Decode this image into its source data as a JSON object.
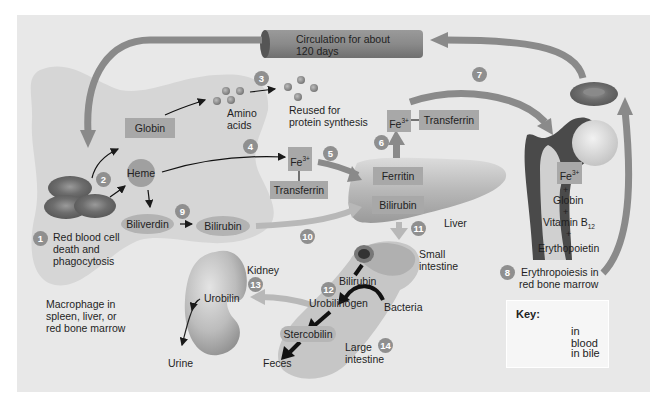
{
  "colors": {
    "background_panel": "#e8e8e8",
    "macrophage": "#d6d6d6",
    "blood_arrow": "#8a8a8a",
    "bile_arrow": "#b8b8b8",
    "box_fill": "#a8a8a8",
    "step_badge": "#8f8f8f",
    "red_cell": "#7a7a7a"
  },
  "circulation": {
    "label_line1": "Circulation for about",
    "label_line2": "120 days"
  },
  "macrophage": {
    "label_line1": "Macrophage in",
    "label_line2": "spleen, liver, or",
    "label_line3": "red bone marrow"
  },
  "steps": [
    {
      "num": "1",
      "text_line1": "Red blood cell",
      "text_line2": "death and",
      "text_line3": "phagocytosis"
    },
    {
      "num": "2"
    },
    {
      "num": "3"
    },
    {
      "num": "4"
    },
    {
      "num": "5"
    },
    {
      "num": "6"
    },
    {
      "num": "7"
    },
    {
      "num": "8",
      "text_line1": "Erythropoiesis in",
      "text_line2": "red bone marrow"
    },
    {
      "num": "9"
    },
    {
      "num": "10"
    },
    {
      "num": "11"
    },
    {
      "num": "12"
    },
    {
      "num": "13"
    },
    {
      "num": "14"
    }
  ],
  "nodes": {
    "globin": "Globin",
    "heme": "Heme",
    "biliverdin": "Biliverdin",
    "bilirubin_macrophage": "Bilirubin",
    "amino_acids_line1": "Amino",
    "amino_acids_line2": "acids",
    "reused_line1": "Reused for",
    "reused_line2": "protein synthesis",
    "fe_4": "Fe",
    "fe_4_sup": "3+",
    "transferrin_4": "Transferrin",
    "fe_6": "Fe",
    "fe_6_sup": "3+",
    "transferrin_6": "Transferrin",
    "ferritin": "Ferritin",
    "bilirubin_liver": "Bilirubin",
    "liver": "Liver",
    "small_intestine_line1": "Small",
    "small_intestine_line2": "intestine",
    "bilirubin_intestine": "Bilirubin",
    "urobilinogen": "Urobilinogen",
    "bacteria": "Bacteria",
    "stercobilin": "Stercobilin",
    "large_intestine_line1": "Large",
    "large_intestine_line2": "intestine",
    "feces": "Feces",
    "kidney": "Kidney",
    "urobilin": "Urobilin",
    "urine": "Urine",
    "marrow_fe": "Fe",
    "marrow_fe_sup": "3+",
    "plus": "+",
    "marrow_globin": "Globin",
    "marrow_vitamin": "Vitamin B",
    "marrow_vitamin_sub": "12",
    "marrow_epo": "Erythopoietin"
  },
  "key": {
    "title": "Key:",
    "items": [
      {
        "label": "in blood",
        "color": "#8a8a8a"
      },
      {
        "label": "in bile",
        "color": "#b8b8b8"
      }
    ]
  }
}
